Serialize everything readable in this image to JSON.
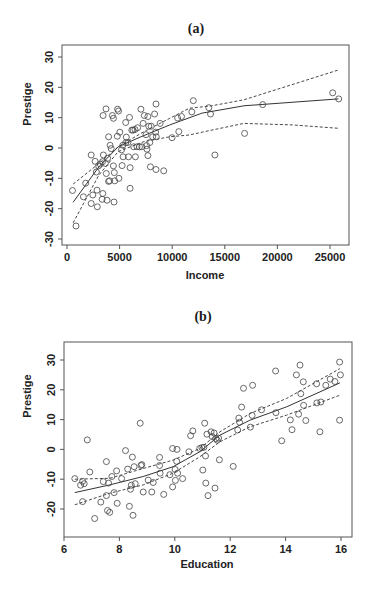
{
  "chart_data": [
    {
      "id": "a",
      "type": "scatter",
      "title": "(a)",
      "xlabel": "Income",
      "ylabel": "Prestige",
      "xlim": [
        0,
        26500
      ],
      "ylim": [
        -33,
        33
      ],
      "xticks": [
        0,
        5000,
        10000,
        15000,
        20000,
        25000
      ],
      "yticks": [
        -30,
        -20,
        -10,
        0,
        10,
        20,
        30
      ],
      "grid": false,
      "legend": null,
      "layout": {
        "frame": [
          62,
          45,
          349,
          245
        ],
        "x_px": [
          67,
          330
        ],
        "x_val": [
          0,
          25000
        ],
        "y_px": [
          239,
          57
        ],
        "y_val": [
          -30,
          30
        ]
      },
      "points": [
        [
          520,
          -14.0
        ],
        [
          860,
          -25.7
        ],
        [
          1560,
          -16.1
        ],
        [
          1780,
          -11.6
        ],
        [
          2300,
          -2.3
        ],
        [
          2300,
          -18.3
        ],
        [
          2450,
          -15.5
        ],
        [
          2670,
          -4.4
        ],
        [
          2790,
          -7.9
        ],
        [
          2850,
          -13.9
        ],
        [
          2880,
          -19.4
        ],
        [
          3000,
          -5.9
        ],
        [
          3160,
          -5.3
        ],
        [
          3370,
          -4.5
        ],
        [
          3460,
          -2.3
        ],
        [
          3430,
          10.7
        ],
        [
          3400,
          -15.0
        ],
        [
          3340,
          -16.9
        ],
        [
          3650,
          -5.1
        ],
        [
          3710,
          12.9
        ],
        [
          3740,
          -8.4
        ],
        [
          3800,
          -17.2
        ],
        [
          3860,
          -3.4
        ],
        [
          3950,
          -11.0
        ],
        [
          3950,
          3.7
        ],
        [
          4040,
          -10.8
        ],
        [
          4100,
          0.9
        ],
        [
          4200,
          -0.2
        ],
        [
          4320,
          10.7
        ],
        [
          4410,
          9.8
        ],
        [
          4410,
          -5.9
        ],
        [
          4470,
          -17.8
        ],
        [
          4500,
          -8.1
        ],
        [
          4530,
          -10.8
        ],
        [
          4780,
          3.9
        ],
        [
          4810,
          12.8
        ],
        [
          4900,
          12.2
        ],
        [
          4930,
          -10.0
        ],
        [
          5020,
          5.2
        ],
        [
          5180,
          -0.6
        ],
        [
          5240,
          -5.8
        ],
        [
          5300,
          0.9
        ],
        [
          5330,
          -2.9
        ],
        [
          5580,
          8.4
        ],
        [
          5580,
          1.7
        ],
        [
          5640,
          3.6
        ],
        [
          5790,
          1.8
        ],
        [
          5850,
          -2.9
        ],
        [
          5940,
          10.1
        ],
        [
          6000,
          -6.5
        ],
        [
          6000,
          -13.3
        ],
        [
          6160,
          5.9
        ],
        [
          6280,
          5.9
        ],
        [
          6340,
          0.4
        ],
        [
          6460,
          6.1
        ],
        [
          6500,
          -2.9
        ],
        [
          6650,
          0.4
        ],
        [
          6710,
          6.7
        ],
        [
          6890,
          0.4
        ],
        [
          7020,
          12.8
        ],
        [
          7110,
          0.4
        ],
        [
          7230,
          8.1
        ],
        [
          7350,
          10.7
        ],
        [
          7510,
          4.4
        ],
        [
          7570,
          0.8
        ],
        [
          7600,
          -0.4
        ],
        [
          7690,
          -2.5
        ],
        [
          7690,
          10.4
        ],
        [
          7780,
          7.2
        ],
        [
          7870,
          1.8
        ],
        [
          7930,
          -6.2
        ],
        [
          8000,
          7.2
        ],
        [
          8150,
          3.7
        ],
        [
          8330,
          11.2
        ],
        [
          8460,
          14.5
        ],
        [
          8420,
          5.2
        ],
        [
          8460,
          -7.1
        ],
        [
          8490,
          3.7
        ],
        [
          8850,
          8.1
        ],
        [
          9190,
          -7.5
        ],
        [
          9990,
          3.4
        ],
        [
          10510,
          9.9
        ],
        [
          10630,
          5.4
        ],
        [
          10880,
          10.4
        ],
        [
          11860,
          11.9
        ],
        [
          12010,
          15.6
        ],
        [
          13480,
          13.3
        ],
        [
          13640,
          11.2
        ],
        [
          14060,
          -2.3
        ],
        [
          16880,
          4.8
        ],
        [
          18600,
          14.3
        ],
        [
          25260,
          18.2
        ],
        [
          25830,
          16.2
        ]
      ],
      "series": [
        {
          "name": "fit",
          "style": "solid",
          "values": [
            [
              580,
              -17.9
            ],
            [
              3030,
              -6.2
            ],
            [
              4870,
              0.4
            ],
            [
              7020,
              3.7
            ],
            [
              9770,
              7.6
            ],
            [
              12840,
              11.5
            ],
            [
              16820,
              13.9
            ],
            [
              25800,
              16.2
            ]
          ]
        },
        {
          "name": "upper band",
          "style": "dashed",
          "values": [
            [
              580,
              -11.9
            ],
            [
              3030,
              -5.1
            ],
            [
              4870,
              0.4
            ],
            [
              7320,
              5.4
            ],
            [
              9770,
              9.8
            ],
            [
              11610,
              13.1
            ],
            [
              13760,
              13.9
            ],
            [
              16820,
              15.9
            ],
            [
              25800,
              25.7
            ]
          ]
        },
        {
          "name": "lower band",
          "style": "dashed",
          "values": [
            [
              580,
              -24.7
            ],
            [
              3030,
              -8.9
            ],
            [
              4870,
              -1.2
            ],
            [
              7320,
              2.1
            ],
            [
              9770,
              3.7
            ],
            [
              11610,
              4.3
            ],
            [
              13760,
              5.9
            ],
            [
              16820,
              8.1
            ],
            [
              21420,
              7.6
            ],
            [
              25800,
              6.5
            ]
          ]
        }
      ]
    },
    {
      "id": "b",
      "type": "scatter",
      "title": "(b)",
      "xlabel": "Education",
      "ylabel": "Prestige",
      "xlim": [
        6,
        16.4
      ],
      "ylim": [
        -29,
        36
      ],
      "xticks": [
        6,
        8,
        10,
        12,
        14,
        16
      ],
      "yticks": [
        -20,
        -10,
        0,
        10,
        20,
        30
      ],
      "grid": false,
      "legend": null,
      "layout": {
        "frame": [
          64,
          342,
          352,
          537
        ],
        "x_px": [
          64,
          341
        ],
        "x_val": [
          6,
          16
        ],
        "y_px": [
          509,
          360
        ],
        "y_val": [
          -20,
          30
        ]
      },
      "points": [
        [
          6.39,
          -9.8
        ],
        [
          6.6,
          -12.0
        ],
        [
          6.67,
          -10.7
        ],
        [
          6.73,
          -11.5
        ],
        [
          6.67,
          -17.5
        ],
        [
          6.84,
          3.2
        ],
        [
          6.93,
          -7.6
        ],
        [
          7.11,
          -23.2
        ],
        [
          7.33,
          -17.7
        ],
        [
          7.42,
          -10.8
        ],
        [
          7.53,
          -4.1
        ],
        [
          7.53,
          -15.5
        ],
        [
          7.57,
          -20.5
        ],
        [
          7.61,
          -11.3
        ],
        [
          7.65,
          -21.1
        ],
        [
          7.73,
          -9.1
        ],
        [
          7.81,
          -14.5
        ],
        [
          7.9,
          -7.2
        ],
        [
          7.92,
          -18.1
        ],
        [
          8.08,
          -9.8
        ],
        [
          8.22,
          -0.4
        ],
        [
          8.3,
          -6.6
        ],
        [
          8.36,
          -19.1
        ],
        [
          8.4,
          -13.4
        ],
        [
          8.43,
          -12.0
        ],
        [
          8.47,
          -2.6
        ],
        [
          8.49,
          -22.1
        ],
        [
          8.53,
          -5.8
        ],
        [
          8.57,
          -11.5
        ],
        [
          8.75,
          8.8
        ],
        [
          8.78,
          -5.4
        ],
        [
          8.81,
          -5.1
        ],
        [
          8.86,
          -14.3
        ],
        [
          9.04,
          -10.3
        ],
        [
          9.17,
          -14.3
        ],
        [
          9.22,
          -11.1
        ],
        [
          9.45,
          -2.7
        ],
        [
          9.45,
          -5.4
        ],
        [
          9.47,
          -8.0
        ],
        [
          9.6,
          -15.1
        ],
        [
          9.82,
          -8.5
        ],
        [
          9.92,
          0.3
        ],
        [
          9.92,
          -12.6
        ],
        [
          10.01,
          -6.7
        ],
        [
          10.02,
          -10.4
        ],
        [
          10.07,
          -4.0
        ],
        [
          10.08,
          0.0
        ],
        [
          10.1,
          -8.0
        ],
        [
          10.28,
          -9.8
        ],
        [
          10.51,
          -0.8
        ],
        [
          10.57,
          4.6
        ],
        [
          10.65,
          6.2
        ],
        [
          10.9,
          0.3
        ],
        [
          10.98,
          0.6
        ],
        [
          11.01,
          -6.9
        ],
        [
          11.05,
          0.7
        ],
        [
          11.08,
          8.8
        ],
        [
          11.11,
          -2.2
        ],
        [
          11.12,
          -11.3
        ],
        [
          11.16,
          5.1
        ],
        [
          11.2,
          -15.5
        ],
        [
          11.31,
          5.9
        ],
        [
          11.35,
          4.3
        ],
        [
          11.42,
          5.5
        ],
        [
          11.45,
          -13.0
        ],
        [
          11.48,
          3.6
        ],
        [
          11.53,
          3.1
        ],
        [
          11.58,
          3.8
        ],
        [
          11.61,
          -3.5
        ],
        [
          12.11,
          -5.7
        ],
        [
          12.27,
          6.5
        ],
        [
          12.31,
          10.5
        ],
        [
          12.34,
          9.1
        ],
        [
          12.41,
          14.2
        ],
        [
          12.48,
          20.5
        ],
        [
          12.73,
          7.5
        ],
        [
          12.79,
          11.4
        ],
        [
          12.81,
          21.5
        ],
        [
          13.13,
          13.3
        ],
        [
          13.64,
          26.3
        ],
        [
          13.65,
          12.3
        ],
        [
          13.86,
          2.9
        ],
        [
          14.17,
          9.9
        ],
        [
          14.23,
          6.6
        ],
        [
          14.39,
          25.0
        ],
        [
          14.47,
          11.8
        ],
        [
          14.52,
          28.3
        ],
        [
          14.55,
          18.7
        ],
        [
          14.64,
          22.7
        ],
        [
          14.65,
          14.8
        ],
        [
          14.73,
          9.7
        ],
        [
          15.12,
          22.0
        ],
        [
          15.13,
          15.6
        ],
        [
          15.24,
          5.9
        ],
        [
          15.27,
          15.9
        ],
        [
          15.45,
          21.5
        ],
        [
          15.61,
          23.6
        ],
        [
          15.78,
          22.8
        ],
        [
          15.95,
          29.3
        ],
        [
          15.95,
          9.8
        ],
        [
          15.98,
          25.0
        ]
      ],
      "series": [
        {
          "name": "fit",
          "style": "solid",
          "values": [
            [
              6.39,
              -14.5
            ],
            [
              7.65,
              -11.9
            ],
            [
              8.86,
              -9.1
            ],
            [
              9.94,
              -5.8
            ],
            [
              10.9,
              -0.8
            ],
            [
              11.63,
              4.8
            ],
            [
              12.71,
              9.8
            ],
            [
              14.04,
              14.3
            ],
            [
              15.96,
              22.3
            ]
          ]
        },
        {
          "name": "upper band",
          "style": "dashed",
          "values": [
            [
              6.39,
              -10.0
            ],
            [
              7.65,
              -9.7
            ],
            [
              8.86,
              -6.4
            ],
            [
              9.94,
              -3.6
            ],
            [
              10.9,
              0.3
            ],
            [
              11.63,
              5.9
            ],
            [
              12.71,
              12.0
            ],
            [
              14.04,
              17.1
            ],
            [
              15.96,
              27.1
            ]
          ]
        },
        {
          "name": "lower band",
          "style": "dashed",
          "values": [
            [
              6.39,
              -18.6
            ],
            [
              7.65,
              -14.7
            ],
            [
              8.86,
              -11.9
            ],
            [
              9.94,
              -8.0
            ],
            [
              10.9,
              -2.5
            ],
            [
              11.63,
              2.6
            ],
            [
              12.71,
              7.6
            ],
            [
              14.04,
              11.5
            ],
            [
              15.96,
              18.2
            ]
          ]
        }
      ]
    }
  ]
}
